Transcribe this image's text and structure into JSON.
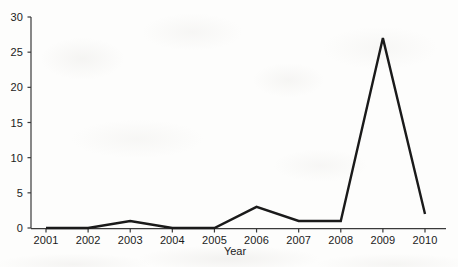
{
  "chart_data": {
    "type": "line",
    "title": "",
    "subtitle": "",
    "xlabel": "Year",
    "ylabel": "",
    "categories": [
      "2001",
      "2002",
      "2003",
      "2004",
      "2005",
      "2006",
      "2007",
      "2008",
      "2009",
      "2010"
    ],
    "x": [
      2001,
      2002,
      2003,
      2004,
      2005,
      2006,
      2007,
      2008,
      2009,
      2010
    ],
    "values": [
      0,
      0,
      1,
      0,
      0,
      3,
      1,
      1,
      27,
      2
    ],
    "series": [
      {
        "name": "Publications",
        "values": [
          0,
          0,
          1,
          0,
          0,
          3,
          1,
          1,
          27,
          2
        ],
        "color": "#1a1a1a",
        "line_width": 2.4,
        "markers": false
      }
    ],
    "xlim": [
      2001,
      2010
    ],
    "ylim": [
      0,
      30
    ],
    "ytick_values": [
      0,
      5,
      10,
      15,
      20,
      25,
      30
    ],
    "ytick_labels": [
      "0",
      "5",
      "10",
      "15",
      "20",
      "25",
      "30"
    ],
    "xtick_labels": [
      "2001",
      "2002",
      "2003",
      "2004",
      "2005",
      "2006",
      "2007",
      "2008",
      "2009",
      "2010"
    ],
    "grid": false,
    "legend": false,
    "legend_position": "none",
    "annotations": [],
    "axis_color": "#3a3a3a",
    "text_color": "#1b1b1b",
    "background_color": "#fdfdfc"
  },
  "axes": {
    "y_axis_name": "value-axis",
    "x_axis_name": "year-axis",
    "x_title": "Year"
  }
}
